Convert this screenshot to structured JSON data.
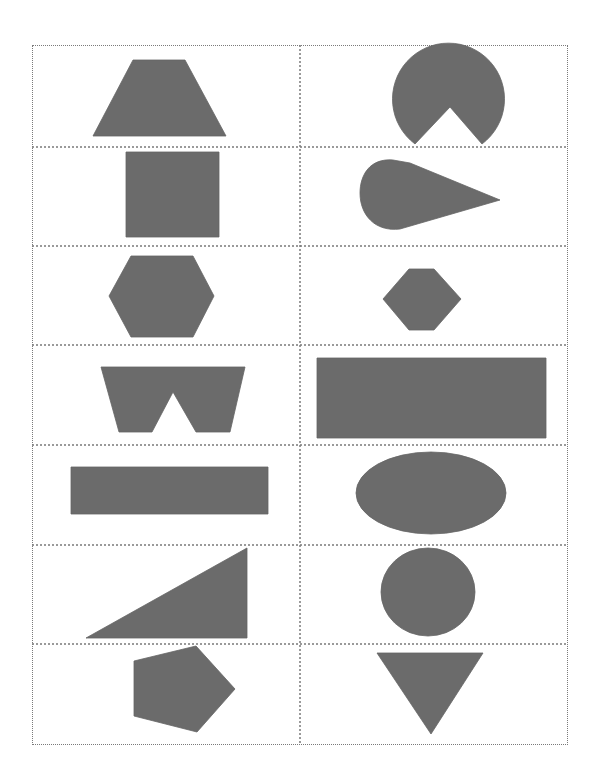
{
  "worksheet": {
    "title": "",
    "grid": {
      "rows": 7,
      "columns": 2,
      "left": 32,
      "top": 45,
      "right": 568,
      "bottom": 745,
      "column_divider_x": 300,
      "row_dividers_y": [
        147,
        246,
        345,
        445,
        545,
        644
      ],
      "line_style": "dotted",
      "line_color": "#7a7a7a"
    },
    "shape_fill_color": "#6b6b6b",
    "cells": [
      {
        "row": 1,
        "col": 1,
        "shape": "trapezoid"
      },
      {
        "row": 1,
        "col": 2,
        "shape": "circle-with-wedge-cutout"
      },
      {
        "row": 2,
        "col": 1,
        "shape": "square"
      },
      {
        "row": 2,
        "col": 2,
        "shape": "teardrop"
      },
      {
        "row": 3,
        "col": 1,
        "shape": "hexagon-large"
      },
      {
        "row": 3,
        "col": 2,
        "shape": "hexagon-small"
      },
      {
        "row": 4,
        "col": 1,
        "shape": "w-shape-notched-trapezoid"
      },
      {
        "row": 4,
        "col": 2,
        "shape": "rectangle-wide"
      },
      {
        "row": 5,
        "col": 1,
        "shape": "rectangle-long"
      },
      {
        "row": 5,
        "col": 2,
        "shape": "ellipse"
      },
      {
        "row": 6,
        "col": 1,
        "shape": "right-triangle"
      },
      {
        "row": 6,
        "col": 2,
        "shape": "circle"
      },
      {
        "row": 7,
        "col": 1,
        "shape": "pentagon"
      },
      {
        "row": 7,
        "col": 2,
        "shape": "inverted-triangle"
      }
    ]
  }
}
